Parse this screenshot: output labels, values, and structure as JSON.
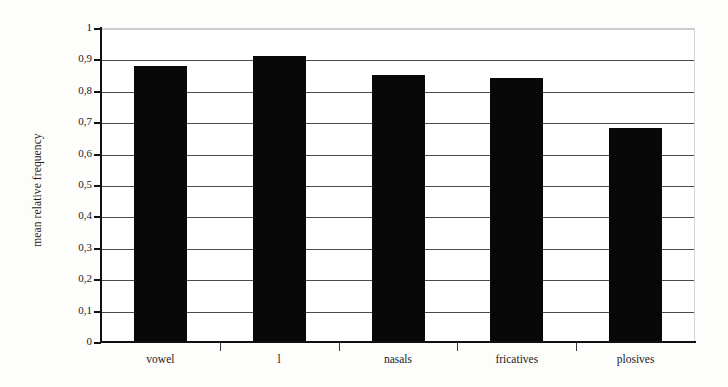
{
  "chart_data": {
    "type": "bar",
    "title": "",
    "xlabel": "",
    "ylabel": "mean relative frequency",
    "categories": [
      "vowel",
      "l",
      "nasals",
      "fricatives",
      "plosives"
    ],
    "values": [
      0.88,
      0.91,
      0.85,
      0.84,
      0.68
    ],
    "ylim": [
      0,
      1
    ],
    "ytick_values": [
      0,
      0.1,
      0.2,
      0.3,
      0.4,
      0.5,
      0.6,
      0.7,
      0.8,
      0.9,
      1
    ],
    "ytick_labels": [
      "0",
      "0,1",
      "0,2",
      "0,3",
      "0,4",
      "0,5",
      "0,6",
      "0,7",
      "0,8",
      "0,9",
      "1"
    ],
    "decimal_separator": ",",
    "grid": true,
    "grid_axis": "y",
    "legend": false,
    "bar_color": "#080808",
    "gridline_color": "#4a4a4a",
    "axis_color": "#111111",
    "background_color": "#ffffff"
  }
}
